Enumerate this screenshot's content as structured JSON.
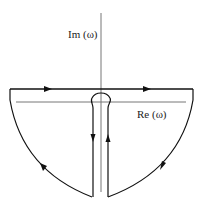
{
  "diagram": {
    "axes": {
      "imaginary_label": "Im (ω)",
      "real_label": "Re (ω)"
    },
    "colors": {
      "contour": "#111111",
      "axis": "#777777",
      "background": "#ffffff"
    },
    "contour_segments": [
      {
        "name": "top-line",
        "direction": "left-to-right",
        "arrows": 2
      },
      {
        "name": "right-arc",
        "direction": "clockwise-down",
        "arrows": 1
      },
      {
        "name": "right-keyhole-line",
        "direction": "up",
        "arrows": 1
      },
      {
        "name": "keyhole-cap",
        "direction": "around-origin"
      },
      {
        "name": "left-keyhole-line",
        "direction": "down",
        "arrows": 1
      },
      {
        "name": "left-arc",
        "direction": "up",
        "arrows": 1
      }
    ]
  }
}
